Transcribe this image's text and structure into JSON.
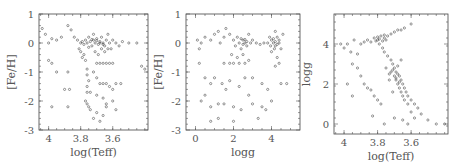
{
  "chart_data": [
    {
      "type": "scatter",
      "title": "",
      "xlabel": "log(Teff)",
      "ylabel": "[Fe/H]",
      "xlim": [
        4.06,
        3.38
      ],
      "ylim": [
        -3,
        1
      ],
      "xticks": [
        4,
        3.8,
        3.6
      ],
      "xtick_labels": [
        "4",
        "3.8",
        "3.6"
      ],
      "yticks": [
        1,
        0,
        -1,
        -2,
        -3
      ],
      "ytick_labels": [
        "1",
        "0",
        "-1",
        "-2",
        "-3"
      ],
      "grid": false,
      "frame": {
        "x": 39,
        "y": 14,
        "w": 109,
        "h": 116
      },
      "points": [
        [
          4.04,
          0.5
        ],
        [
          4.02,
          0.3
        ],
        [
          4.0,
          0.0
        ],
        [
          3.98,
          0.15
        ],
        [
          3.95,
          0.1
        ],
        [
          3.92,
          0.2
        ],
        [
          3.88,
          0.6
        ],
        [
          3.86,
          0.45
        ],
        [
          3.84,
          0.2
        ],
        [
          3.82,
          0.1
        ],
        [
          3.8,
          0.0
        ],
        [
          3.79,
          0.05
        ],
        [
          3.78,
          -0.05
        ],
        [
          3.77,
          0.1
        ],
        [
          3.76,
          0.0
        ],
        [
          3.75,
          0.2
        ],
        [
          3.74,
          0.05
        ],
        [
          3.73,
          -0.1
        ],
        [
          3.72,
          0.1
        ],
        [
          3.71,
          0.0
        ],
        [
          3.7,
          0.15
        ],
        [
          3.69,
          -0.05
        ],
        [
          3.68,
          0.05
        ],
        [
          3.67,
          0.2
        ],
        [
          3.66,
          0.0
        ],
        [
          3.65,
          -0.1
        ],
        [
          3.64,
          0.1
        ],
        [
          3.63,
          0.3
        ],
        [
          3.62,
          0.0
        ],
        [
          3.61,
          -0.2
        ],
        [
          3.6,
          0.1
        ],
        [
          3.58,
          0.0
        ],
        [
          3.56,
          -0.1
        ],
        [
          3.54,
          0.05
        ],
        [
          3.5,
          0.0
        ],
        [
          3.45,
          0.0
        ],
        [
          3.42,
          -0.8
        ],
        [
          3.4,
          -0.9
        ],
        [
          3.81,
          -0.2
        ],
        [
          3.8,
          -0.3
        ],
        [
          3.79,
          -0.5
        ],
        [
          3.78,
          -0.4
        ],
        [
          3.77,
          -0.6
        ],
        [
          3.76,
          -0.9
        ],
        [
          3.76,
          -1.1
        ],
        [
          3.75,
          -1.3
        ],
        [
          3.76,
          -1.5
        ],
        [
          3.76,
          -1.7
        ],
        [
          3.77,
          -2.0
        ],
        [
          3.76,
          -2.1
        ],
        [
          3.75,
          -2.2
        ],
        [
          3.74,
          -2.3
        ],
        [
          3.72,
          -2.6
        ],
        [
          3.7,
          -2.4
        ],
        [
          3.68,
          -2.7
        ],
        [
          3.66,
          -2.5
        ],
        [
          3.64,
          -2.2
        ],
        [
          3.7,
          -0.7
        ],
        [
          3.68,
          -0.7
        ],
        [
          3.66,
          -0.7
        ],
        [
          3.64,
          -0.7
        ],
        [
          3.62,
          -0.7
        ],
        [
          3.6,
          -0.7
        ],
        [
          3.72,
          -1.0
        ],
        [
          3.7,
          -1.2
        ],
        [
          3.68,
          -1.4
        ],
        [
          3.66,
          -1.4
        ],
        [
          3.64,
          -1.4
        ],
        [
          3.62,
          -1.5
        ],
        [
          3.6,
          -1.6
        ],
        [
          3.58,
          -1.4
        ],
        [
          3.55,
          -1.4
        ],
        [
          3.7,
          -1.8
        ],
        [
          3.66,
          -1.9
        ],
        [
          3.64,
          -2.1
        ],
        [
          3.6,
          -2.0
        ],
        [
          3.58,
          -2.3
        ],
        [
          4.0,
          -0.6
        ],
        [
          3.98,
          -0.7
        ],
        [
          3.95,
          -1.0
        ],
        [
          3.88,
          -1.0
        ],
        [
          3.9,
          -1.6
        ],
        [
          3.87,
          -1.6
        ],
        [
          3.98,
          -2.2
        ],
        [
          3.88,
          -2.2
        ],
        [
          3.74,
          -1.7
        ],
        [
          3.72,
          0.3
        ],
        [
          3.71,
          -0.3
        ],
        [
          3.69,
          -0.4
        ],
        [
          3.67,
          -0.2
        ],
        [
          3.65,
          -0.3
        ],
        [
          3.63,
          -0.2
        ],
        [
          3.66,
          -0.05
        ],
        [
          3.68,
          0.0
        ],
        [
          3.7,
          0.08
        ],
        [
          3.73,
          0.12
        ],
        [
          3.75,
          -0.15
        ]
      ]
    },
    {
      "type": "scatter",
      "title": "",
      "xlabel": "logg",
      "ylabel": "[Fe/H]",
      "xlim": [
        -0.5,
        5.5
      ],
      "ylim": [
        -3,
        1
      ],
      "xticks": [
        0,
        2,
        4
      ],
      "xtick_labels": [
        "0",
        "2",
        "4"
      ],
      "yticks": [
        1,
        0,
        -1,
        -2,
        -3
      ],
      "ytick_labels": [
        "1",
        "0",
        "-1",
        "-2",
        "-3"
      ],
      "grid": false,
      "frame": {
        "x": 186,
        "y": 14,
        "w": 114,
        "h": 116
      },
      "points": [
        [
          0.1,
          0.1
        ],
        [
          0.2,
          -0.2
        ],
        [
          0.3,
          0.0
        ],
        [
          0.5,
          0.2
        ],
        [
          0.8,
          0.1
        ],
        [
          1.0,
          0.3
        ],
        [
          1.2,
          0.4
        ],
        [
          1.3,
          0.0
        ],
        [
          1.5,
          0.2
        ],
        [
          1.6,
          0.5
        ],
        [
          1.8,
          0.3
        ],
        [
          2.0,
          0.1
        ],
        [
          2.1,
          -0.1
        ],
        [
          2.2,
          0.2
        ],
        [
          2.3,
          0.0
        ],
        [
          2.4,
          -0.2
        ],
        [
          2.5,
          0.1
        ],
        [
          2.6,
          0.0
        ],
        [
          2.7,
          -0.1
        ],
        [
          2.8,
          0.3
        ],
        [
          2.9,
          0.0
        ],
        [
          3.0,
          0.1
        ],
        [
          3.2,
          0.0
        ],
        [
          3.4,
          -0.05
        ],
        [
          3.6,
          0.0
        ],
        [
          3.8,
          0.0
        ],
        [
          3.9,
          0.2
        ],
        [
          4.0,
          0.1
        ],
        [
          4.1,
          0.0
        ],
        [
          4.2,
          -0.1
        ],
        [
          4.3,
          0.2
        ],
        [
          4.4,
          0.0
        ],
        [
          4.5,
          -0.2
        ],
        [
          4.6,
          0.3
        ],
        [
          4.2,
          0.4
        ],
        [
          4.0,
          -0.3
        ],
        [
          4.3,
          -0.5
        ],
        [
          4.4,
          -0.7
        ],
        [
          4.2,
          -0.8
        ],
        [
          4.5,
          -1.4
        ],
        [
          1.5,
          -0.7
        ],
        [
          1.8,
          -0.7
        ],
        [
          2.0,
          -0.7
        ],
        [
          2.3,
          -0.7
        ],
        [
          2.6,
          -0.7
        ],
        [
          2.8,
          -0.6
        ],
        [
          2.2,
          -0.5
        ],
        [
          2.5,
          -0.4
        ],
        [
          1.9,
          -0.4
        ],
        [
          0.2,
          -0.7
        ],
        [
          0.5,
          -1.2
        ],
        [
          0.8,
          -1.4
        ],
        [
          1.0,
          -1.2
        ],
        [
          1.4,
          -1.4
        ],
        [
          1.8,
          -1.3
        ],
        [
          2.3,
          -1.5
        ],
        [
          2.6,
          -1.2
        ],
        [
          3.0,
          -1.2
        ],
        [
          3.5,
          -1.4
        ],
        [
          0.3,
          -2.0
        ],
        [
          0.5,
          -1.8
        ],
        [
          0.8,
          -2.2
        ],
        [
          1.2,
          -2.1
        ],
        [
          1.5,
          -2.1
        ],
        [
          2.0,
          -2.2
        ],
        [
          2.4,
          -2.3
        ],
        [
          3.0,
          -2.1
        ],
        [
          3.5,
          -2.2
        ],
        [
          4.0,
          -2.0
        ],
        [
          0.8,
          -2.7
        ],
        [
          1.2,
          -2.6
        ],
        [
          2.0,
          -2.7
        ],
        [
          3.3,
          -2.6
        ],
        [
          1.6,
          -1.6
        ],
        [
          2.8,
          -1.8
        ],
        [
          3.8,
          -1.6
        ],
        [
          4.8,
          -1.4
        ],
        [
          3.7,
          -2.3
        ],
        [
          2.4,
          0.15
        ],
        [
          2.5,
          -0.05
        ],
        [
          2.6,
          0.12
        ],
        [
          2.7,
          0.05
        ],
        [
          4.1,
          0.15
        ],
        [
          4.2,
          0.05
        ],
        [
          4.3,
          -0.05
        ],
        [
          4.4,
          0.1
        ],
        [
          3.95,
          -0.1
        ],
        [
          4.15,
          -0.2
        ]
      ]
    },
    {
      "type": "scatter",
      "title": "",
      "xlabel": "log(Teff)",
      "ylabel": "logg",
      "xlim": [
        4.06,
        3.38
      ],
      "ylim": [
        -0.5,
        5.5
      ],
      "xticks": [
        4,
        3.8,
        3.6
      ],
      "xtick_labels": [
        "4",
        "3.8",
        "3.6"
      ],
      "yticks": [
        4,
        2,
        0
      ],
      "ytick_labels": [
        "4",
        "2",
        "0"
      ],
      "grid": false,
      "frame": {
        "x": 334,
        "y": 14,
        "w": 114,
        "h": 120
      },
      "points": [
        [
          4.02,
          4.0
        ],
        [
          4.0,
          3.8
        ],
        [
          3.98,
          4.0
        ],
        [
          3.96,
          3.6
        ],
        [
          3.94,
          4.2
        ],
        [
          3.92,
          3.5
        ],
        [
          3.9,
          4.0
        ],
        [
          3.88,
          4.1
        ],
        [
          3.86,
          4.2
        ],
        [
          3.84,
          4.1
        ],
        [
          3.82,
          4.3
        ],
        [
          3.8,
          4.2
        ],
        [
          3.78,
          4.4
        ],
        [
          3.76,
          4.3
        ],
        [
          3.74,
          4.4
        ],
        [
          3.72,
          4.5
        ],
        [
          3.7,
          4.6
        ],
        [
          3.68,
          4.7
        ],
        [
          3.66,
          4.7
        ],
        [
          3.64,
          4.8
        ],
        [
          3.6,
          5.0
        ],
        [
          3.79,
          4.0
        ],
        [
          3.77,
          3.8
        ],
        [
          3.76,
          3.6
        ],
        [
          3.74,
          3.4
        ],
        [
          3.72,
          3.2
        ],
        [
          3.71,
          3.0
        ],
        [
          3.7,
          2.8
        ],
        [
          3.69,
          2.6
        ],
        [
          3.68,
          2.5
        ],
        [
          3.67,
          2.4
        ],
        [
          3.66,
          2.2
        ],
        [
          3.65,
          2.0
        ],
        [
          3.64,
          1.8
        ],
        [
          3.63,
          1.6
        ],
        [
          3.62,
          1.4
        ],
        [
          3.6,
          1.2
        ],
        [
          3.58,
          1.0
        ],
        [
          3.56,
          0.8
        ],
        [
          3.54,
          0.5
        ],
        [
          3.5,
          0.2
        ],
        [
          3.45,
          0.0
        ],
        [
          3.72,
          2.6
        ],
        [
          3.7,
          2.4
        ],
        [
          3.69,
          2.2
        ],
        [
          3.68,
          2.0
        ],
        [
          3.67,
          1.8
        ],
        [
          3.66,
          1.6
        ],
        [
          3.65,
          1.4
        ],
        [
          3.64,
          1.2
        ],
        [
          3.62,
          1.0
        ],
        [
          3.6,
          0.6
        ],
        [
          3.58,
          0.3
        ],
        [
          3.95,
          3.0
        ],
        [
          3.92,
          2.8
        ],
        [
          3.9,
          2.4
        ],
        [
          3.88,
          2.0
        ],
        [
          3.86,
          1.8
        ],
        [
          3.84,
          1.7
        ],
        [
          3.82,
          1.4
        ],
        [
          3.8,
          1.2
        ],
        [
          3.78,
          1.0
        ],
        [
          3.95,
          1.4
        ],
        [
          3.98,
          2.0
        ],
        [
          3.83,
          0.4
        ],
        [
          3.76,
          0.0
        ],
        [
          3.7,
          0.3
        ],
        [
          3.65,
          0.2
        ],
        [
          3.62,
          0.0
        ],
        [
          3.4,
          0.0
        ],
        [
          3.75,
          2.8
        ],
        [
          3.73,
          2.2
        ],
        [
          3.71,
          1.6
        ],
        [
          3.68,
          2.9
        ],
        [
          3.66,
          3.2
        ],
        [
          3.8,
          4.35
        ],
        [
          3.81,
          4.15
        ],
        [
          3.79,
          4.25
        ],
        [
          3.77,
          4.15
        ],
        [
          3.76,
          4.45
        ],
        [
          3.75,
          4.2
        ],
        [
          3.73,
          2.5
        ],
        [
          3.71,
          2.7
        ],
        [
          3.69,
          2.3
        ],
        [
          3.67,
          2.1
        ]
      ]
    }
  ]
}
